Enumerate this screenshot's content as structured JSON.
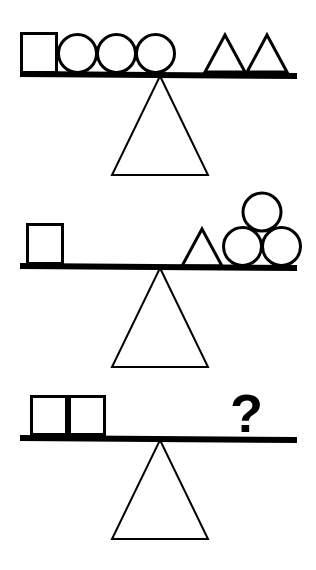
{
  "puzzle": {
    "title": "Balance scale weight puzzle",
    "unknown_symbol": "?",
    "stroke_color": "#000000",
    "fill_color": "#ffffff",
    "background_color": "#ffffff",
    "bar_color": "#000000",
    "scales": [
      {
        "id": "scale-1",
        "state": "balanced",
        "left_pan": {
          "shapes": [
            {
              "shape": "square",
              "count": 1
            },
            {
              "shape": "circle",
              "count": 3
            }
          ],
          "shape_labels": [
            "square",
            "circle",
            "circle",
            "circle"
          ]
        },
        "right_pan": {
          "shapes": [
            {
              "shape": "triangle",
              "count": 2
            }
          ],
          "shape_labels": [
            "triangle",
            "triangle"
          ]
        }
      },
      {
        "id": "scale-2",
        "state": "balanced",
        "left_pan": {
          "shapes": [
            {
              "shape": "square",
              "count": 1
            }
          ],
          "shape_labels": [
            "square"
          ]
        },
        "right_pan": {
          "shapes": [
            {
              "shape": "triangle",
              "count": 1
            },
            {
              "shape": "circle",
              "count": 3
            }
          ],
          "shape_labels": [
            "triangle",
            "circle",
            "circle",
            "circle"
          ]
        }
      },
      {
        "id": "scale-3",
        "state": "question",
        "left_pan": {
          "shapes": [
            {
              "shape": "square",
              "count": 2
            }
          ],
          "shape_labels": [
            "square",
            "square"
          ]
        },
        "right_pan": {
          "shapes": [
            {
              "shape": "question-mark",
              "count": 1
            }
          ],
          "shape_labels": [
            "question-mark"
          ],
          "text": "?"
        }
      }
    ]
  }
}
